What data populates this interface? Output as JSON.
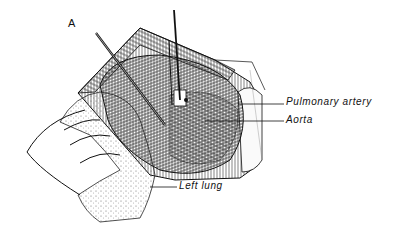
{
  "figure": {
    "panel_letter": "A",
    "labels": [
      {
        "id": "pulmonary-artery",
        "text": "Pulmonary artery"
      },
      {
        "id": "aorta",
        "text": "Aorta"
      },
      {
        "id": "left-lung",
        "text": "Left lung"
      }
    ],
    "colors": {
      "ink": "#111111",
      "background": "#ffffff"
    }
  }
}
